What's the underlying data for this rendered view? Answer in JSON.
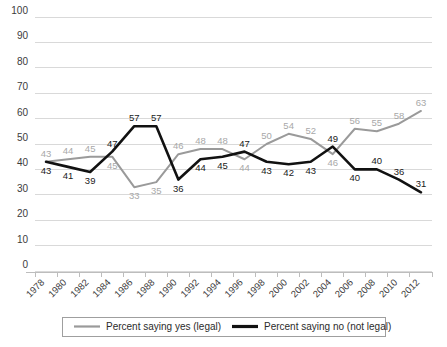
{
  "chart_data": {
    "type": "line",
    "title": "",
    "subtitle": "",
    "xlabel": "",
    "ylabel": "",
    "ylim": [
      0,
      100
    ],
    "ytick_step": 10,
    "yticks": [
      "0",
      "10",
      "20",
      "30",
      "40",
      "50",
      "60",
      "70",
      "80",
      "90",
      "100"
    ],
    "grid": true,
    "legend_position": "bottom",
    "categories": [
      "1978",
      "1980",
      "1982",
      "1984",
      "1986",
      "1988",
      "1990",
      "1992",
      "1994",
      "1996",
      "1998",
      "2000",
      "2002",
      "2004",
      "2006",
      "2008",
      "2010",
      "2012"
    ],
    "series": [
      {
        "name": "Percent saying yes (legal)",
        "color": "#9a9a9a",
        "label_color": "#a8a8a8",
        "values": [
          43,
          44,
          45,
          45,
          33,
          35,
          46,
          48,
          48,
          44,
          50,
          54,
          52,
          46,
          56,
          55,
          58,
          63
        ],
        "label_positions": [
          "above",
          "above",
          "above",
          "below",
          "below",
          "below",
          "above",
          "above",
          "above",
          "below",
          "above",
          "above",
          "above",
          "below",
          "above",
          "above",
          "above",
          "above"
        ]
      },
      {
        "name": "Percent saying no (not legal)",
        "color": "#111111",
        "label_color": "#1a1a1a",
        "values": [
          43,
          41,
          39,
          47,
          57,
          57,
          36,
          44,
          45,
          47,
          43,
          42,
          43,
          49,
          40,
          40,
          36,
          31
        ],
        "label_positions": [
          "below",
          "below",
          "below",
          "above",
          "above",
          "above",
          "below",
          "below",
          "below",
          "above",
          "below",
          "below",
          "below",
          "above",
          "below",
          "above",
          "above",
          "above"
        ]
      }
    ]
  },
  "legend": {
    "items": [
      {
        "label": "Percent saying yes (legal)",
        "color": "#9a9a9a",
        "swatch": "line-swatch-gray"
      },
      {
        "label": "Percent saying no (not legal)",
        "color": "#111111",
        "swatch": "line-swatch-black"
      }
    ]
  },
  "axes": {
    "y_axis_name": "percent-axis",
    "x_axis_name": "year-axis",
    "grid_color": "#d9d9d9",
    "axis_color": "#bdbdbd"
  }
}
